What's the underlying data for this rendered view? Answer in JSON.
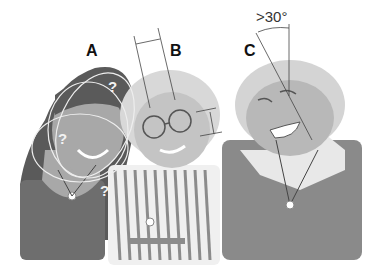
{
  "figure": {
    "labels": {
      "a": "A",
      "b": "B",
      "c": "C"
    },
    "angle_annotation": ">30°",
    "question_marks": [
      "?",
      "?",
      "?"
    ],
    "colors": {
      "background": "#ffffff",
      "hair_dark": "#5a5a5a",
      "hair_light": "#d4d4d4",
      "skin_left": "#a8a8a8",
      "skin_middle": "#c4c4c4",
      "skin_right": "#b8b8b8",
      "top_dark": "#6e6e6e",
      "stripe": "#8c8c8c",
      "annotation_line": "#444444",
      "circle_overlay": "#eeeeee"
    }
  }
}
